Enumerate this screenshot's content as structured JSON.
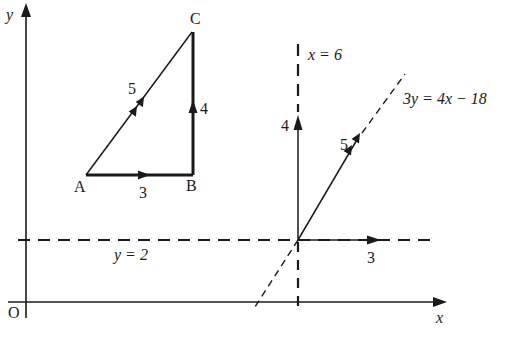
{
  "figure": {
    "colors": {
      "ink": "#1a1a1a",
      "background": "#ffffff"
    }
  },
  "axes": {
    "x_label": "x",
    "y_label": "y",
    "origin_label": "O"
  },
  "triangle": {
    "vertices": {
      "A": "A",
      "B": "B",
      "C": "C"
    },
    "sides": {
      "AB": {
        "label": "3",
        "arrows": 1
      },
      "BC": {
        "label": "4",
        "arrows": 1
      },
      "AC": {
        "label": "5",
        "arrows": 2
      }
    }
  },
  "lines": {
    "vertical": {
      "label": "x = 6",
      "style": "dashed"
    },
    "horizontal": {
      "label": "y = 2",
      "style": "dashed"
    },
    "slanted": {
      "label": "3y = 4x − 18",
      "style": "dashed"
    }
  },
  "vectors_at_intersection": {
    "horizontal": {
      "label": "3",
      "arrows": 1
    },
    "vertical": {
      "label": "4",
      "arrows": 1
    },
    "resultant": {
      "label": "5",
      "arrows": 2
    }
  }
}
